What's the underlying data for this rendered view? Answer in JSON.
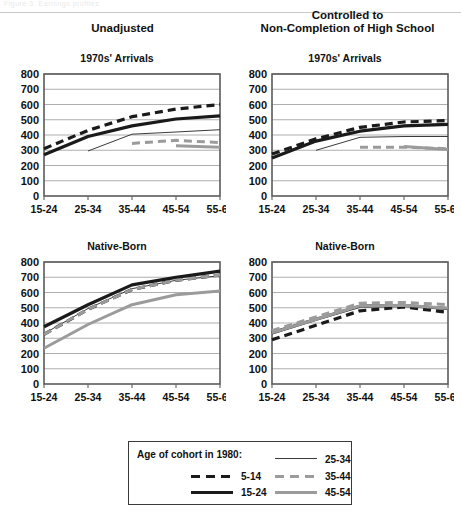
{
  "header": {
    "faint_text": "Figure 3.  Earnings profiles",
    "left_column": "Unadjusted",
    "right_column_line1": "Controlled to",
    "right_column_line2": "Non-Completion of High School"
  },
  "axis": {
    "y_ticks": [
      0,
      100,
      200,
      300,
      400,
      500,
      600,
      700,
      800
    ],
    "x_ticks": [
      "15-24",
      "25-34",
      "35-44",
      "45-54",
      "55-64"
    ],
    "ylim": [
      0,
      800
    ],
    "grid": true
  },
  "legend": {
    "title": "Age of cohort in 1980:",
    "position": "bottom-center",
    "entries": [
      {
        "label": "5-14",
        "style": "dashed",
        "color": "#1a1a1a",
        "width": 3.2
      },
      {
        "label": "15-24",
        "style": "solid",
        "color": "#1a1a1a",
        "width": 3.2
      },
      {
        "label": "25-34",
        "style": "solid",
        "color": "#3a3a3a",
        "width": 1.0
      },
      {
        "label": "35-44",
        "style": "dashed",
        "color": "#9b9b9b",
        "width": 3.0
      },
      {
        "label": "45-54",
        "style": "solid",
        "color": "#9b9b9b",
        "width": 3.0
      }
    ]
  },
  "chart_data": [
    {
      "id": "unadjusted-1970s-arrivals",
      "type": "line",
      "title": "1970s' Arrivals",
      "column": "Unadjusted",
      "xlabel": "",
      "ylabel": "",
      "ylim": [
        0,
        800
      ],
      "categories": [
        "15-24",
        "25-34",
        "35-44",
        "45-54",
        "55-64"
      ],
      "series": [
        {
          "name": "5-14",
          "style": "dashed",
          "color": "#1a1a1a",
          "width": 3.2,
          "values": [
            310,
            430,
            520,
            570,
            600
          ]
        },
        {
          "name": "15-24",
          "style": "solid",
          "color": "#1a1a1a",
          "width": 3.2,
          "values": [
            270,
            390,
            460,
            505,
            525
          ]
        },
        {
          "name": "25-34",
          "style": "solid",
          "color": "#3a3a3a",
          "width": 1.0,
          "values": [
            null,
            295,
            405,
            420,
            435
          ]
        },
        {
          "name": "35-44",
          "style": "dashed",
          "color": "#9b9b9b",
          "width": 3.0,
          "values": [
            null,
            null,
            345,
            365,
            350
          ]
        },
        {
          "name": "45-54",
          "style": "solid",
          "color": "#9b9b9b",
          "width": 3.0,
          "values": [
            null,
            null,
            null,
            330,
            320
          ]
        }
      ]
    },
    {
      "id": "controlled-1970s-arrivals",
      "type": "line",
      "title": "1970s' Arrivals",
      "column": "Controlled to Non-Completion of High School",
      "xlabel": "",
      "ylabel": "",
      "ylim": [
        0,
        800
      ],
      "categories": [
        "15-24",
        "25-34",
        "35-44",
        "45-54",
        "55-64"
      ],
      "series": [
        {
          "name": "5-14",
          "style": "dashed",
          "color": "#1a1a1a",
          "width": 3.2,
          "values": [
            275,
            375,
            450,
            485,
            495
          ]
        },
        {
          "name": "15-24",
          "style": "solid",
          "color": "#1a1a1a",
          "width": 3.2,
          "values": [
            250,
            360,
            425,
            460,
            470
          ]
        },
        {
          "name": "25-34",
          "style": "solid",
          "color": "#3a3a3a",
          "width": 1.0,
          "values": [
            null,
            300,
            385,
            390,
            390
          ]
        },
        {
          "name": "35-44",
          "style": "dashed",
          "color": "#9b9b9b",
          "width": 3.0,
          "values": [
            null,
            null,
            320,
            320,
            310
          ]
        },
        {
          "name": "45-54",
          "style": "solid",
          "color": "#9b9b9b",
          "width": 3.0,
          "values": [
            null,
            null,
            null,
            325,
            305
          ]
        }
      ]
    },
    {
      "id": "unadjusted-native-born",
      "type": "line",
      "title": "Native-Born",
      "column": "Unadjusted",
      "xlabel": "",
      "ylabel": "",
      "ylim": [
        0,
        800
      ],
      "categories": [
        "15-24",
        "25-34",
        "35-44",
        "45-54",
        "55-64"
      ],
      "series": [
        {
          "name": "5-14",
          "style": "dashed",
          "color": "#1a1a1a",
          "width": 3.2,
          "values": [
            325,
            490,
            620,
            680,
            715
          ]
        },
        {
          "name": "15-24",
          "style": "solid",
          "color": "#1a1a1a",
          "width": 3.2,
          "values": [
            375,
            520,
            650,
            700,
            740
          ]
        },
        {
          "name": "25-34",
          "style": "solid",
          "color": "#3a3a3a",
          "width": 1.0,
          "values": [
            330,
            495,
            625,
            680,
            710
          ]
        },
        {
          "name": "35-44",
          "style": "dashed",
          "color": "#9b9b9b",
          "width": 3.0,
          "values": [
            325,
            490,
            620,
            680,
            715
          ]
        },
        {
          "name": "45-54",
          "style": "solid",
          "color": "#9b9b9b",
          "width": 3.0,
          "values": [
            235,
            390,
            520,
            585,
            610
          ]
        }
      ]
    },
    {
      "id": "controlled-native-born",
      "type": "line",
      "title": "Native-Born",
      "column": "Controlled to Non-Completion of High School",
      "xlabel": "",
      "ylabel": "",
      "ylim": [
        0,
        800
      ],
      "categories": [
        "15-24",
        "25-34",
        "35-44",
        "45-54",
        "55-64"
      ],
      "series": [
        {
          "name": "5-14",
          "style": "dashed",
          "color": "#1a1a1a",
          "width": 3.2,
          "values": [
            290,
            385,
            480,
            505,
            470
          ]
        },
        {
          "name": "15-24",
          "style": "solid",
          "color": "#1a1a1a",
          "width": 3.2,
          "values": [
            335,
            425,
            510,
            515,
            495
          ]
        },
        {
          "name": "25-34",
          "style": "solid",
          "color": "#3a3a3a",
          "width": 1.0,
          "values": [
            335,
            425,
            510,
            515,
            495
          ]
        },
        {
          "name": "35-44",
          "style": "dashed",
          "color": "#9b9b9b",
          "width": 3.0,
          "values": [
            350,
            440,
            530,
            535,
            520
          ]
        },
        {
          "name": "45-54",
          "style": "solid",
          "color": "#9b9b9b",
          "width": 3.0,
          "values": [
            335,
            425,
            512,
            517,
            497
          ]
        }
      ]
    }
  ]
}
